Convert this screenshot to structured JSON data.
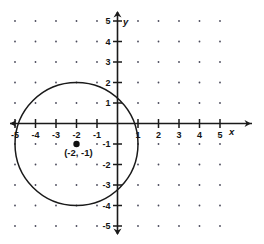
{
  "chart_data": {
    "type": "scatter",
    "title": "",
    "xlabel": "x",
    "ylabel": "y",
    "xlim": [
      -5.6,
      5.6
    ],
    "ylim": [
      -5.6,
      5.6
    ],
    "grid": "dotted-lattice",
    "x_ticks": [
      -5,
      -4,
      -3,
      -2,
      -1,
      1,
      2,
      3,
      4,
      5
    ],
    "y_ticks": [
      5,
      4,
      3,
      2,
      1,
      -1,
      -2,
      -3,
      -4,
      -5
    ],
    "x_tick_labels": [
      "-5",
      "-4",
      "-3",
      "-2",
      "-1",
      "1",
      "2",
      "3",
      "4",
      "5"
    ],
    "y_tick_labels": [
      "5",
      "4",
      "3",
      "2",
      "1",
      "-1",
      "-2",
      "-3",
      "-4",
      "-5"
    ],
    "shapes": [
      {
        "type": "circle",
        "center_x": -2,
        "center_y": -1,
        "radius": 3,
        "stroke": "#1a1a1a",
        "fill": "none"
      }
    ],
    "points": [
      {
        "x": -2,
        "y": -1,
        "label": "(-2, -1)",
        "marker": "filled-circle",
        "color": "#111111"
      }
    ],
    "series": [
      {
        "name": "center-point",
        "x": [
          -2
        ],
        "y": [
          -1
        ]
      }
    ],
    "legend": [],
    "annotations": [
      {
        "text": "(-2, -1)",
        "x": -2.6,
        "y": -1.6
      }
    ]
  },
  "axes": {
    "x_axis_name": "x",
    "y_axis_name": "y",
    "x_ticks": [
      {
        "value": -5,
        "label": "-5",
        "px": 14.5
      },
      {
        "value": -4,
        "label": "-4",
        "px": 35.0
      },
      {
        "value": -3,
        "label": "-3",
        "px": 55.5
      },
      {
        "value": -2,
        "label": "-2",
        "px": 76.0
      },
      {
        "value": -1,
        "label": "-1",
        "px": 96.5
      },
      {
        "value": 1,
        "label": "1",
        "px": 137.5
      },
      {
        "value": 2,
        "label": "2",
        "px": 158.0
      },
      {
        "value": 3,
        "label": "3",
        "px": 178.5
      },
      {
        "value": 4,
        "label": "4",
        "px": 199.0
      },
      {
        "value": 5,
        "label": "5",
        "px": 219.5
      }
    ],
    "y_ticks": [
      {
        "value": 5,
        "label": "5",
        "px": 21.0
      },
      {
        "value": 4,
        "label": "4",
        "px": 41.5
      },
      {
        "value": 3,
        "label": "3",
        "px": 62.0
      },
      {
        "value": 2,
        "label": "2",
        "px": 82.5
      },
      {
        "value": 1,
        "label": "1",
        "px": 103.0
      },
      {
        "value": -1,
        "label": "-1",
        "px": 144.0
      },
      {
        "value": -2,
        "label": "-2",
        "px": 164.5
      },
      {
        "value": -3,
        "label": "-3",
        "px": 185.0
      },
      {
        "value": -4,
        "label": "-4",
        "px": 205.5
      },
      {
        "value": -5,
        "label": "-5",
        "px": 226.0
      }
    ]
  },
  "colors": {
    "axis": "#1a1a1a",
    "curve": "#1a1a1a",
    "grid_dot": "#4a4a5a",
    "text": "#141414",
    "background": "#ffffff"
  }
}
